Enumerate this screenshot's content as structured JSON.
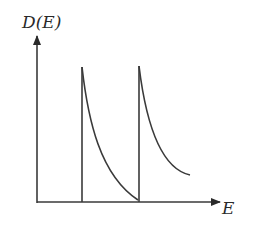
{
  "diagram": {
    "y_axis_label": "D(E)",
    "x_axis_label": "E",
    "spikes": [
      {
        "x": 82,
        "top_y": 67,
        "curve_end": [
          138,
          200
        ]
      },
      {
        "x": 139,
        "top_y": 66,
        "curve_end": [
          190,
          175
        ]
      }
    ],
    "colors": {
      "line": "#3a3a3a",
      "text": "#2a2a2a",
      "background": "#ffffff"
    }
  }
}
